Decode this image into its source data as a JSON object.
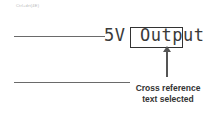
{
  "caption": "Ctrl+drt(4E)",
  "schematic": {
    "net_label_prefix": "5V",
    "net_label_suffix": "Output",
    "selection_color": "#333333"
  },
  "annotation": {
    "line1": "Cross reference",
    "line2": "text selected"
  },
  "icons": {
    "arrow": "arrow-up-icon"
  }
}
